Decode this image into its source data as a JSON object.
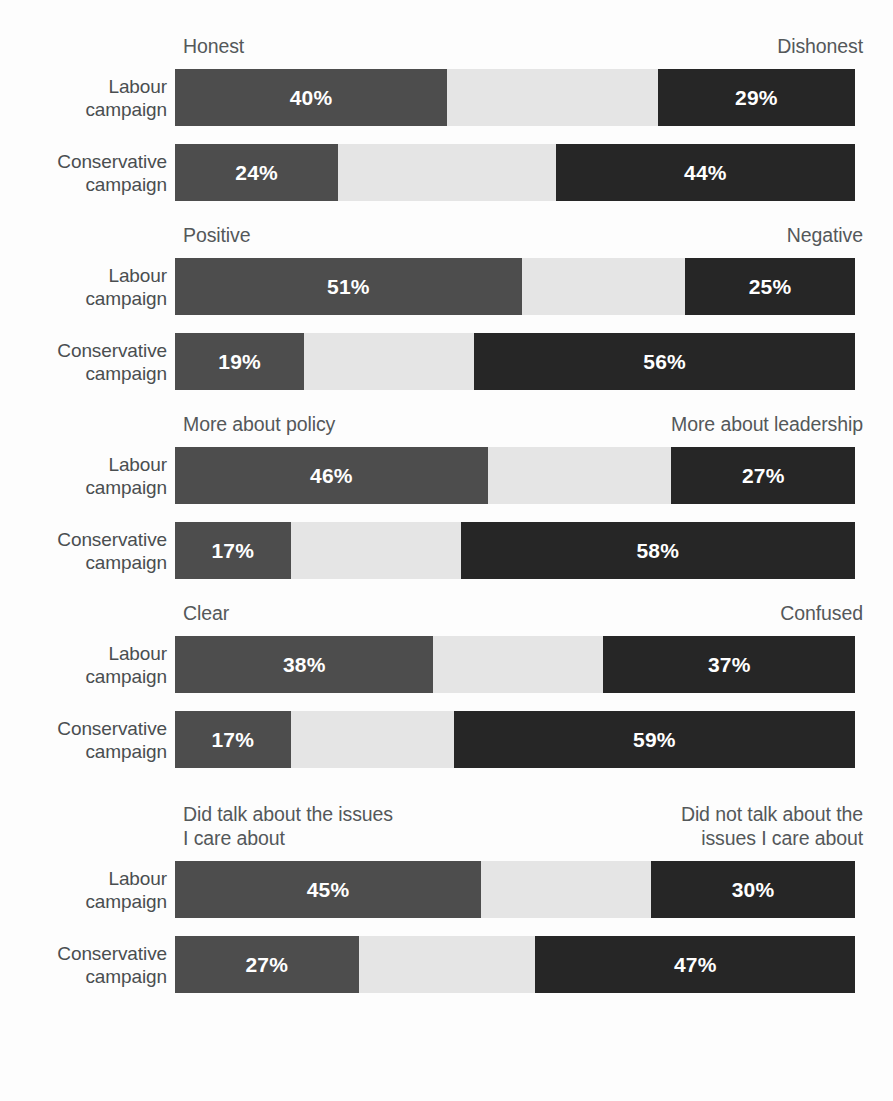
{
  "chart_data": {
    "type": "bar",
    "subtype": "diverging-stacked-bar",
    "title": "",
    "xlabel": "",
    "ylabel": "",
    "xlim": [
      0,
      100
    ],
    "grid": false,
    "legend": null,
    "value_suffix": "%",
    "categories": [
      "Labour campaign",
      "Conservative campaign"
    ],
    "series": [
      {
        "name": "left-attribute",
        "color": "#4d4d4d"
      },
      {
        "name": "neither / middle",
        "color": "#e5e5e5"
      },
      {
        "name": "right-attribute",
        "color": "#262626"
      }
    ],
    "sections": [
      {
        "id": "honest",
        "pole_left": "Honest",
        "pole_right": "Dishonest",
        "rows": [
          {
            "label": "Labour\ncampaign",
            "left": 40,
            "right": 29,
            "left_value": "40%",
            "right_value": "29%"
          },
          {
            "label": "Conservative\ncampaign",
            "left": 24,
            "right": 44,
            "left_value": "24%",
            "right_value": "44%"
          }
        ]
      },
      {
        "id": "positive",
        "pole_left": "Positive",
        "pole_right": "Negative",
        "rows": [
          {
            "label": "Labour\ncampaign",
            "left": 51,
            "right": 25,
            "left_value": "51%",
            "right_value": "25%"
          },
          {
            "label": "Conservative\ncampaign",
            "left": 19,
            "right": 56,
            "left_value": "19%",
            "right_value": "56%"
          }
        ]
      },
      {
        "id": "policy-leadership",
        "pole_left": "More about policy",
        "pole_right": "More about leadership",
        "rows": [
          {
            "label": "Labour\ncampaign",
            "left": 46,
            "right": 27,
            "left_value": "46%",
            "right_value": "27%"
          },
          {
            "label": "Conservative\ncampaign",
            "left": 17,
            "right": 58,
            "left_value": "17%",
            "right_value": "58%"
          }
        ]
      },
      {
        "id": "clear-confused",
        "pole_left": "Clear",
        "pole_right": "Confused",
        "rows": [
          {
            "label": "Labour\ncampaign",
            "left": 38,
            "right": 37,
            "left_value": "38%",
            "right_value": "37%"
          },
          {
            "label": "Conservative\ncampaign",
            "left": 17,
            "right": 59,
            "left_value": "17%",
            "right_value": "59%"
          }
        ]
      },
      {
        "id": "issues-i-care-about",
        "pole_left": "Did talk about the issues\nI care about",
        "pole_right": "Did not talk about the\nissues I care about",
        "two_line": true,
        "rows": [
          {
            "label": "Labour\ncampaign",
            "left": 45,
            "right": 30,
            "left_value": "45%",
            "right_value": "30%"
          },
          {
            "label": "Conservative\ncampaign",
            "left": 27,
            "right": 47,
            "left_value": "27%",
            "right_value": "47%"
          }
        ]
      }
    ]
  }
}
